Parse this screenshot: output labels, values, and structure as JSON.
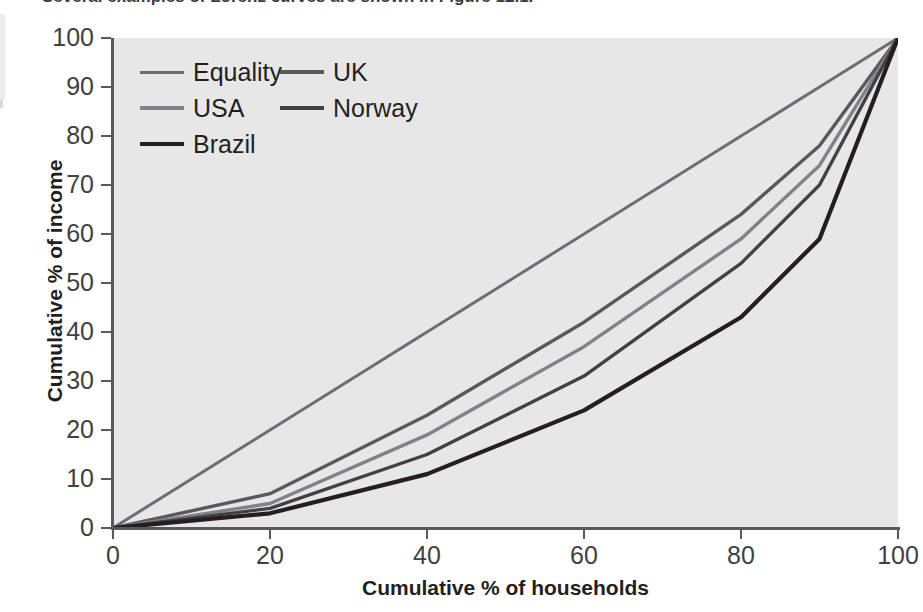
{
  "page": {
    "top_text_cutoff": "Several examples of Lorenz curves are shown in Figure 12.1."
  },
  "chart_data": {
    "type": "line",
    "title": "",
    "xlabel": "Cumulative % of households",
    "ylabel": "Cumulative % of income",
    "xlim": [
      0,
      100
    ],
    "ylim": [
      0,
      100
    ],
    "xticks": [
      0,
      20,
      40,
      60,
      80,
      100
    ],
    "yticks": [
      0,
      10,
      20,
      30,
      40,
      50,
      60,
      70,
      80,
      90,
      100
    ],
    "grid": false,
    "legend_position": "top-left-inside",
    "plot_background": "#e7e7e7",
    "x": [
      0,
      20,
      40,
      60,
      80,
      90,
      100
    ],
    "series": [
      {
        "name": "Equality",
        "color": "#6d6e71",
        "width": 3.0,
        "values": [
          0,
          20,
          40,
          60,
          80,
          90,
          100
        ]
      },
      {
        "name": "UK",
        "color": "#58595b",
        "width": 3.4,
        "values": [
          0,
          7,
          23,
          42,
          64,
          78,
          100
        ]
      },
      {
        "name": "USA",
        "color": "#808285",
        "width": 3.4,
        "values": [
          0,
          5,
          19,
          37,
          59,
          74,
          100
        ]
      },
      {
        "name": "Norway",
        "color": "#414042",
        "width": 3.4,
        "values": [
          0,
          4,
          15,
          31,
          54,
          70,
          100
        ]
      },
      {
        "name": "Brazil",
        "color": "#231f20",
        "width": 4.2,
        "values": [
          0,
          3,
          11,
          24,
          43,
          59,
          100
        ]
      }
    ]
  },
  "legend": {
    "rows": [
      [
        {
          "label": "Equality",
          "color": "#6d6e71",
          "width": 3.0
        },
        {
          "label": "UK",
          "color": "#58595b",
          "width": 3.4
        }
      ],
      [
        {
          "label": "USA",
          "color": "#808285",
          "width": 3.4
        },
        {
          "label": "Norway",
          "color": "#414042",
          "width": 3.4
        }
      ],
      [
        {
          "label": "Brazil",
          "color": "#231f20",
          "width": 4.2
        }
      ]
    ]
  }
}
